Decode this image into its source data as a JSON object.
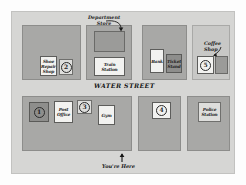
{
  "map": {
    "title": "Town Map",
    "street_label": "WATER STREET",
    "you_are_here_label": "You're Here",
    "you_are_here_arrow": "up-arrow",
    "colors": {
      "page_background": "#ffffff",
      "map_background": "#d6d6d4",
      "block_fill": "#a8a8a6",
      "block_fill_light": "#c8c8c6",
      "building_white": "#f2f2f0",
      "building_pale": "#dededc",
      "building_dark": "#8e8e8c",
      "ink": "#1f1f1f"
    },
    "annotations": [
      {
        "id": "department-store",
        "text": "Department\nStore",
        "arrow": "curved-arrow-down-right"
      },
      {
        "id": "coffee-shop",
        "text": "Coffee\nShop",
        "arrow": "curved-arrow-down-left"
      }
    ],
    "blocks": [
      {
        "id": "block-northwest",
        "fill": "block",
        "buildings": [
          {
            "id": "shoe-repair-shop",
            "label": "Shoe\nRepair\nShop",
            "style": "white",
            "number": null
          },
          {
            "id": "building-2",
            "label": "",
            "style": "pale",
            "number": "2"
          }
        ]
      },
      {
        "id": "block-north-central",
        "fill": "block",
        "buildings": [
          {
            "id": "department-store",
            "label": "",
            "style": "mid",
            "number": null
          },
          {
            "id": "train-station",
            "label": "Train\nStation",
            "style": "white",
            "number": null
          }
        ]
      },
      {
        "id": "block-north-east",
        "fill": "block",
        "buildings": [
          {
            "id": "bank",
            "label": "Bank",
            "style": "white",
            "number": null
          },
          {
            "id": "ticket-stand",
            "label": "Ticket\nStand",
            "style": "dark",
            "number": null
          }
        ]
      },
      {
        "id": "block-northeast-corner",
        "fill": "block-light",
        "buildings": [
          {
            "id": "building-5",
            "label": "",
            "style": "white",
            "number": "5"
          },
          {
            "id": "coffee-shop",
            "label": "",
            "style": "mid",
            "number": null
          }
        ]
      },
      {
        "id": "block-southwest",
        "fill": "block",
        "buildings": [
          {
            "id": "building-1",
            "label": "",
            "style": "dark",
            "number": "1"
          },
          {
            "id": "post-office",
            "label": "Post\nOffice",
            "style": "white",
            "number": null
          },
          {
            "id": "building-3",
            "label": "",
            "style": "pale",
            "number": "3"
          },
          {
            "id": "gym",
            "label": "Gym",
            "style": "white",
            "number": null
          }
        ]
      },
      {
        "id": "block-south-central",
        "fill": "block",
        "buildings": [
          {
            "id": "building-4",
            "label": "",
            "style": "white",
            "number": "4"
          }
        ]
      },
      {
        "id": "block-southeast",
        "fill": "block",
        "buildings": [
          {
            "id": "police-station",
            "label": "Police\nStation",
            "style": "pale",
            "number": null
          }
        ]
      }
    ]
  }
}
